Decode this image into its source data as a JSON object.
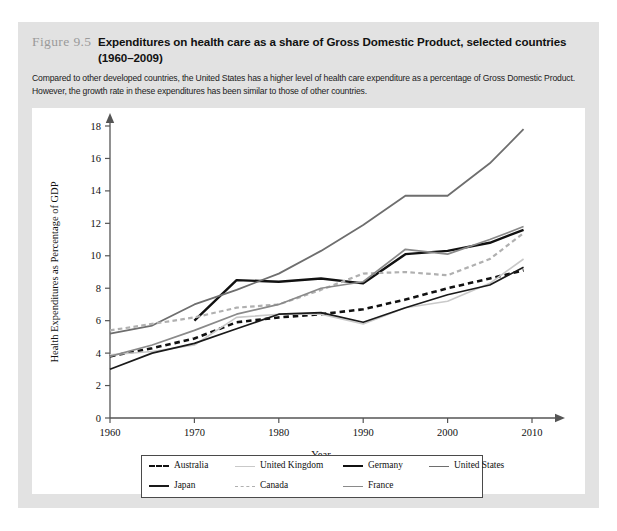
{
  "figure": {
    "number": "Figure 9.5",
    "title_line1": "Expenditures on health care as a share of Gross Domestic Product, selected countries",
    "title_line2": "(1960–2009)",
    "subtitle": "Compared to other developed countries, the United States has a higher level of health care expenditure as a percentage of Gross Domestic Product. However, the growth rate in these expenditures has been similar to those of other countries."
  },
  "colors": {
    "band": "#e2e2e2",
    "panel": "#ffffff",
    "axis": "#555555",
    "australia": "#111111",
    "japan": "#1a1a1a",
    "united_kingdom": "#c9c9c9",
    "canada": "#b0b0b0",
    "germany": "#111111",
    "france": "#8a8a8a",
    "united_states": "#6e6e6e"
  },
  "chart_data": {
    "type": "line",
    "title": "Expenditures on health care as a share of Gross Domestic Product, selected countries (1960–2009)",
    "xlabel": "Year",
    "ylabel": "Health Expenditures as Percentage of GDP",
    "xlim": [
      1960,
      2010
    ],
    "ylim": [
      0,
      18
    ],
    "xticks": [
      1960,
      1970,
      1980,
      1990,
      2000,
      2010
    ],
    "yticks": [
      0,
      2,
      4,
      6,
      8,
      10,
      12,
      14,
      16,
      18
    ],
    "grid": false,
    "legend_position": "bottom",
    "series": [
      {
        "name": "Australia",
        "style": "dashed",
        "color": "#111111",
        "width": 2.6,
        "x": [
          1960,
          1965,
          1970,
          1975,
          1980,
          1985,
          1990,
          1995,
          2000,
          2005,
          2009
        ],
        "y": [
          3.8,
          4.3,
          4.9,
          5.9,
          6.2,
          6.4,
          6.7,
          7.3,
          8.0,
          8.6,
          9.1
        ]
      },
      {
        "name": "United Kingdom",
        "style": "solid",
        "color": "#c9c9c9",
        "width": 1.6,
        "x": [
          1960,
          1965,
          1970,
          1975,
          1980,
          1985,
          1990,
          1995,
          2000,
          2005,
          2009
        ],
        "y": [
          3.9,
          4.1,
          4.5,
          6.2,
          6.4,
          6.4,
          5.8,
          6.8,
          7.2,
          8.3,
          9.8
        ]
      },
      {
        "name": "Germany",
        "style": "solid",
        "color": "#111111",
        "width": 2.4,
        "x": [
          1970,
          1975,
          1980,
          1985,
          1990,
          1995,
          2000,
          2005,
          2009
        ],
        "y": [
          6.0,
          8.5,
          8.4,
          8.6,
          8.3,
          10.1,
          10.3,
          10.8,
          11.6
        ]
      },
      {
        "name": "United States",
        "style": "solid",
        "color": "#6e6e6e",
        "width": 1.8,
        "x": [
          1960,
          1965,
          1970,
          1975,
          1980,
          1985,
          1990,
          1995,
          2000,
          2005,
          2009
        ],
        "y": [
          5.2,
          5.7,
          7.0,
          7.9,
          8.9,
          10.3,
          11.9,
          13.7,
          13.7,
          15.7,
          17.8
        ]
      },
      {
        "name": "Japan",
        "style": "solid",
        "color": "#1a1a1a",
        "width": 1.7,
        "x": [
          1960,
          1965,
          1970,
          1975,
          1980,
          1985,
          1990,
          1995,
          2000,
          2005,
          2009
        ],
        "y": [
          3.0,
          4.0,
          4.6,
          5.5,
          6.4,
          6.5,
          5.9,
          6.8,
          7.6,
          8.2,
          9.3
        ]
      },
      {
        "name": "Canada",
        "style": "dashed",
        "color": "#b0b0b0",
        "width": 2.2,
        "x": [
          1960,
          1965,
          1970,
          1975,
          1980,
          1985,
          1990,
          1995,
          2000,
          2005,
          2009
        ],
        "y": [
          5.4,
          5.8,
          6.2,
          6.8,
          7.0,
          7.9,
          8.9,
          9.0,
          8.8,
          9.8,
          11.4
        ]
      },
      {
        "name": "France",
        "style": "solid",
        "color": "#8a8a8a",
        "width": 1.7,
        "x": [
          1960,
          1965,
          1970,
          1975,
          1980,
          1985,
          1990,
          1995,
          2000,
          2005,
          2009
        ],
        "y": [
          3.8,
          4.5,
          5.4,
          6.4,
          7.0,
          8.0,
          8.4,
          10.4,
          10.1,
          11.0,
          11.8
        ]
      }
    ]
  },
  "legend": {
    "items": [
      {
        "label": "Australia",
        "style": "dashed",
        "color": "#111111"
      },
      {
        "label": "United Kingdom",
        "style": "solid",
        "color": "#c9c9c9"
      },
      {
        "label": "Germany",
        "style": "solid",
        "color": "#111111"
      },
      {
        "label": "United States",
        "style": "solid",
        "color": "#6e6e6e"
      },
      {
        "label": "Japan",
        "style": "solid",
        "color": "#1a1a1a"
      },
      {
        "label": "Canada",
        "style": "dashed",
        "color": "#b0b0b0"
      },
      {
        "label": "France",
        "style": "solid",
        "color": "#8a8a8a"
      }
    ]
  }
}
